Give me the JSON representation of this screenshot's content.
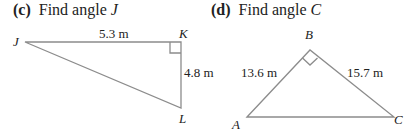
{
  "problems": [
    {
      "tag": "(c)",
      "prompt": "Find angle",
      "target": "J",
      "vertices": {
        "J": "J",
        "K": "K",
        "L": "L"
      },
      "right_angle_at": "K",
      "sides": {
        "JK": "5.3 m",
        "KL": "4.8 m"
      }
    },
    {
      "tag": "(d)",
      "prompt": "Find angle",
      "target": "C",
      "vertices": {
        "A": "A",
        "B": "B",
        "C": "C"
      },
      "right_angle_at": "B",
      "sides": {
        "AB": "13.6 m",
        "BC": "15.7 m"
      }
    }
  ],
  "colors": {
    "line": "#8c8c8c",
    "text": "#222222"
  }
}
